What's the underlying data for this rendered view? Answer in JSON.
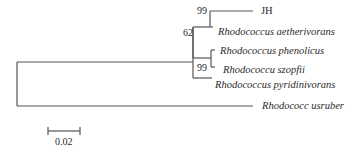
{
  "tree": {
    "type": "phylogenetic-tree",
    "line_color": "#555555",
    "taxa": [
      {
        "name": "JH",
        "italic": false
      },
      {
        "name": "Rhodococcus aetherivorans",
        "italic": true
      },
      {
        "name": "Rhodococcus phenolicus",
        "italic": true
      },
      {
        "name": "Rhodococcu szopfii",
        "italic": true
      },
      {
        "name": "Rhodococcus pyridinivorans",
        "italic": true
      },
      {
        "name": "Rhodococc usruber",
        "italic": true
      }
    ],
    "bootstrap": [
      {
        "value": "99",
        "node": "JH+aetherivorans"
      },
      {
        "value": "62",
        "node": "aetherivorans-group+phenolicus-group"
      },
      {
        "value": "99",
        "node": "phenolicus+szopfii"
      }
    ],
    "scale_bar": {
      "label": "0.02"
    }
  }
}
